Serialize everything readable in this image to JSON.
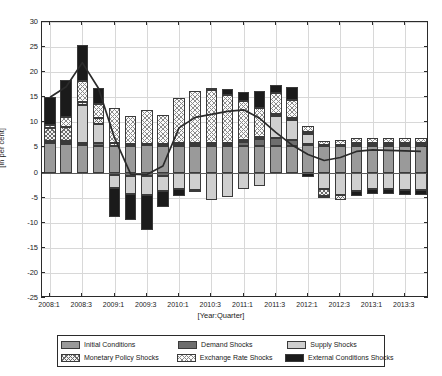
{
  "chart_data": {
    "type": "bar",
    "title": "",
    "subtitle": "",
    "xlabel": "[Year:Quarter]",
    "ylabel": "[In per cent]",
    "ylim": [
      -25,
      30
    ],
    "yticks": [
      -25,
      -20,
      -15,
      -10,
      -5,
      0,
      5,
      10,
      15,
      20,
      25,
      30
    ],
    "ytick_labels": [
      "-25",
      "-20",
      "-15",
      "-10",
      "-5",
      "0",
      "5",
      "10",
      "15",
      "20",
      "25",
      "30"
    ],
    "grid": true,
    "legend_position": "below-axes",
    "stacked": true,
    "categories": [
      "2008:1",
      "2008:2",
      "2008:3",
      "2008:4",
      "2009:1",
      "2009:2",
      "2009:3",
      "2009:4",
      "2010:1",
      "2010:2",
      "2010:3",
      "2010:4",
      "2011:1",
      "2011:2",
      "2011:3",
      "2011:4",
      "2012:1",
      "2012:2",
      "2012:3",
      "2012:4",
      "2013:1",
      "2013:2",
      "2013:3",
      "2013:4"
    ],
    "xtick_labels": [
      "2008:1",
      "2008:3",
      "2009:1",
      "2009:3",
      "2010:1",
      "2010:3",
      "2011:1",
      "2011:3",
      "2012:1",
      "2012:3",
      "2013:1",
      "2013:3"
    ],
    "xtick_indices": [
      0,
      2,
      4,
      6,
      8,
      10,
      12,
      14,
      16,
      18,
      20,
      22
    ],
    "series": [
      {
        "name": "Initial Conditions",
        "key": "initial",
        "color": "#9a9a9a",
        "pattern": "solid-mid-grey",
        "values": [
          5.8,
          5.6,
          5.4,
          5.3,
          5.3,
          5.3,
          5.4,
          5.3,
          5.3,
          5.3,
          5.3,
          5.3,
          5.3,
          5.3,
          5.3,
          5.3,
          5.4,
          5.3,
          5.3,
          5.3,
          5.3,
          5.3,
          5.3,
          5.3
        ]
      },
      {
        "name": "Demand Shocks",
        "key": "demand",
        "color": "#6e6e6e",
        "pattern": "solid-dark-grey",
        "values": [
          0.2,
          0.2,
          0.4,
          0.5,
          -0.5,
          -0.6,
          -0.6,
          -0.6,
          0.2,
          0.3,
          0.3,
          0.3,
          0.7,
          1.3,
          1.5,
          1.2,
          0.3,
          0.2,
          0.2,
          0.2,
          0.2,
          0.2,
          0.2,
          0.2
        ]
      },
      {
        "name": "Supply Shocks",
        "key": "supply",
        "color": "#cfcfcf",
        "pattern": "solid-light-grey",
        "values": [
          0.3,
          0.4,
          7.6,
          3.9,
          -2.6,
          -3.6,
          -3.8,
          -3.1,
          -3.3,
          -3.4,
          -5.4,
          -4.8,
          -3.3,
          -2.6,
          4.4,
          4.0,
          2.0,
          -3.3,
          -4.4,
          -3.6,
          -3.3,
          -3.2,
          -3.4,
          -3.5
        ]
      },
      {
        "name": "Monetary Policy Shocks",
        "key": "monetary",
        "color": "#f2f2f2",
        "pattern": "cross-hatch-dense",
        "values": [
          2.6,
          2.9,
          0.6,
          1.1,
          0.6,
          0.4,
          0.3,
          0.3,
          0.3,
          0.3,
          0.3,
          0.3,
          0.4,
          0.5,
          0.4,
          0.4,
          0.3,
          -1.3,
          -1.0,
          0.4,
          0.4,
          0.4,
          0.4,
          0.4
        ]
      },
      {
        "name": "Exchange Rate Shocks",
        "key": "exchange",
        "color": "#fbfbfb",
        "pattern": "cross-hatch-sparse",
        "values": [
          0.6,
          2.0,
          4.2,
          2.9,
          6.9,
          5.5,
          6.8,
          5.9,
          9.1,
          10.3,
          10.5,
          9.6,
          7.8,
          5.8,
          4.2,
          3.6,
          1.3,
          0.8,
          0.9,
          0.9,
          0.9,
          0.9,
          0.9,
          0.9
        ]
      },
      {
        "name": "External Conditions Shocks",
        "key": "external",
        "color": "#1b1b1b",
        "pattern": "solid-black",
        "values": [
          5.5,
          7.4,
          7.3,
          3.2,
          -5.7,
          -5.3,
          -7.0,
          -3.2,
          -1.3,
          -0.3,
          0.5,
          1.2,
          1.8,
          3.3,
          1.7,
          2.5,
          -0.8,
          -0.5,
          0.0,
          -1.0,
          -1.0,
          -1.0,
          -1.0,
          -1.0
        ]
      }
    ],
    "line": {
      "name": "Headline inflation",
      "color": "#2b2b2b",
      "values": [
        15.0,
        17.1,
        21.9,
        16.8,
        6.9,
        -0.3,
        -0.4,
        1.3,
        8.9,
        11.0,
        11.6,
        12.2,
        12.5,
        10.8,
        8.0,
        5.5,
        3.6,
        2.4,
        3.0,
        4.2,
        4.5,
        4.4,
        4.3,
        4.2
      ]
    }
  },
  "legend": {
    "rows": [
      [
        {
          "label": "Initial Conditions",
          "key": "initial"
        },
        {
          "label": "Demand Shocks",
          "key": "demand"
        },
        {
          "label": "Supply Shocks",
          "key": "supply"
        }
      ],
      [
        {
          "label": "Monetary Policy Shocks",
          "key": "monetary"
        },
        {
          "label": "Exchange Rate Shocks",
          "key": "exchange"
        },
        {
          "label": "External Conditions Shocks",
          "key": "external"
        }
      ]
    ]
  }
}
